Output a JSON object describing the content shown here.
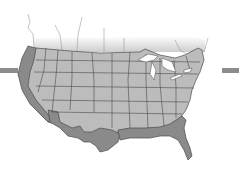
{
  "figure": {
    "type": "map",
    "colors": {
      "background": "#ffffff",
      "interior_states": "#bcbcbc",
      "highlighted_states": "#8a8a8a",
      "borders": "#4a4a4a",
      "lakes": "#ffffff",
      "canada_fade": "#d0d0d0",
      "side_bars": "#8c8c8c"
    },
    "highlighted_regions": [
      "Pacific coast",
      "Southwest border",
      "Gulf coast"
    ],
    "side_bars": [
      {
        "side": "left"
      },
      {
        "side": "right"
      }
    ]
  }
}
